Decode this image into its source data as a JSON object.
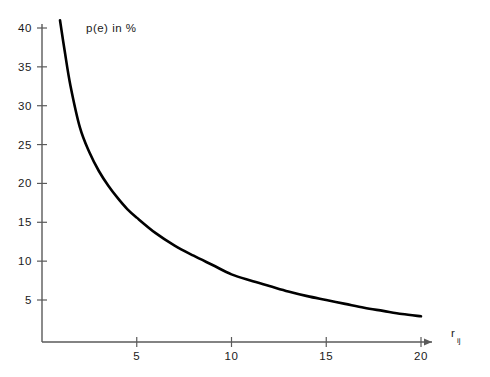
{
  "chart_data": {
    "type": "line",
    "title": "",
    "subtitle": "",
    "xlabel": "r_ij",
    "xlabel_base": "r",
    "xlabel_sub": "ij",
    "ylabel": "p(e) in %",
    "xlim": [
      0,
      21.5
    ],
    "ylim": [
      0,
      42
    ],
    "grid": false,
    "legend": null,
    "x_ticks": [
      5,
      10,
      15,
      20
    ],
    "x_tick_labels": [
      "5",
      "10",
      "15",
      "20"
    ],
    "y_ticks": [
      5,
      10,
      15,
      20,
      25,
      30,
      35,
      40
    ],
    "y_tick_labels": [
      "5",
      "10",
      "15",
      "20",
      "25",
      "30",
      "35",
      "40"
    ],
    "axis_arrow_x": true,
    "series": [
      {
        "name": "p(e)",
        "color": "#000000",
        "line_width": 2.6,
        "x": [
          0.95,
          1.2,
          1.5,
          2.0,
          2.5,
          3.0,
          3.5,
          4.0,
          4.5,
          5.0,
          6.0,
          7.0,
          8.0,
          9.0,
          10.0,
          11.0,
          12.0,
          13.0,
          14.0,
          15.0,
          16.0,
          17.0,
          18.0,
          19.0,
          20.0
        ],
        "y": [
          41.0,
          37.0,
          32.6,
          27.2,
          24.0,
          21.6,
          19.7,
          18.1,
          16.7,
          15.6,
          13.6,
          12.0,
          10.7,
          9.5,
          8.3,
          7.5,
          6.8,
          6.1,
          5.5,
          5.0,
          4.5,
          4.0,
          3.6,
          3.2,
          2.9
        ]
      }
    ]
  },
  "axes": {
    "y_axis_title": "p(e) in %",
    "x_axis_title_base": "r",
    "x_axis_title_sub": "ij"
  },
  "colors": {
    "curve": "#000000",
    "axis": "#5a5a5a",
    "text": "#1a1a1a",
    "background": "#ffffff"
  }
}
